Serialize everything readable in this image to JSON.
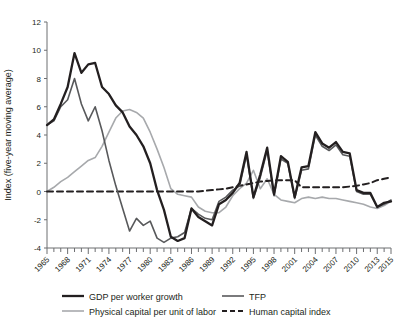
{
  "chart_data": {
    "type": "line",
    "title": "",
    "xlabel": "",
    "ylabel": "Index (five-year moving average)",
    "ylim": [
      -4,
      12
    ],
    "xlim": [
      1965,
      2015
    ],
    "ytick_labels": [
      "12",
      "10",
      "8",
      "6",
      "4",
      "2",
      "0",
      "-2",
      "-4"
    ],
    "ytick_values": [
      12,
      10,
      8,
      6,
      4,
      2,
      0,
      -2,
      -4
    ],
    "xtick_labels": [
      "1965",
      "1968",
      "1971",
      "1974",
      "1977",
      "1980",
      "1983",
      "1986",
      "1989",
      "1992",
      "1995",
      "1998",
      "2001",
      "2004",
      "2007",
      "2010",
      "2013",
      "2015"
    ],
    "xtick_values": [
      1965,
      1968,
      1971,
      1974,
      1977,
      1980,
      1983,
      1986,
      1989,
      1992,
      1995,
      1998,
      2001,
      2004,
      2007,
      2010,
      2013,
      2015
    ],
    "grid": false,
    "legend_position": "bottom",
    "x": [
      1965,
      1966,
      1967,
      1968,
      1969,
      1970,
      1971,
      1972,
      1973,
      1974,
      1975,
      1976,
      1977,
      1978,
      1979,
      1980,
      1981,
      1982,
      1983,
      1984,
      1985,
      1986,
      1987,
      1988,
      1989,
      1990,
      1991,
      1992,
      1993,
      1994,
      1995,
      1996,
      1997,
      1998,
      1999,
      2000,
      2001,
      2002,
      2003,
      2004,
      2005,
      2006,
      2007,
      2008,
      2009,
      2010,
      2011,
      2012,
      2013,
      2014,
      2015
    ],
    "series": [
      {
        "name": "GDP per worker growth",
        "color": "#231f20",
        "width": 2.3,
        "dash": "none",
        "values": [
          4.7,
          5.1,
          6.2,
          7.4,
          9.8,
          8.4,
          9.0,
          9.1,
          7.4,
          6.9,
          6.1,
          5.6,
          4.6,
          4.0,
          3.2,
          2.0,
          0.1,
          -1.3,
          -3.2,
          -3.5,
          -3.3,
          -1.2,
          -1.8,
          -2.1,
          -2.4,
          -0.9,
          -0.6,
          -0.1,
          0.6,
          2.8,
          -0.4,
          1.2,
          3.1,
          -0.2,
          2.5,
          2.1,
          -0.4,
          1.7,
          1.8,
          4.2,
          3.4,
          3.1,
          3.5,
          2.8,
          2.7,
          0.1,
          -0.1,
          -0.1,
          -1.1,
          -0.8,
          -0.7
        ]
      },
      {
        "name": "TFP",
        "color": "#58595b",
        "width": 1.6,
        "dash": "none",
        "values": [
          4.7,
          5.0,
          6.0,
          6.5,
          8.0,
          6.2,
          5.0,
          6.0,
          4.3,
          2.2,
          0.4,
          -1.2,
          -2.8,
          -1.9,
          -2.4,
          -2.1,
          -3.3,
          -3.6,
          -3.3,
          -3.2,
          -2.9,
          -1.2,
          -1.6,
          -1.9,
          -2.0,
          -0.7,
          -0.4,
          0.1,
          0.4,
          2.6,
          -0.5,
          1.0,
          2.9,
          -0.3,
          2.3,
          2.0,
          -0.5,
          1.5,
          1.6,
          4.0,
          3.2,
          2.9,
          3.3,
          2.6,
          2.5,
          0.0,
          -0.2,
          -0.2,
          -1.1,
          -0.9,
          -0.6
        ]
      },
      {
        "name": "Physical capital per unit of labor",
        "color": "#a7a9ac",
        "width": 1.6,
        "dash": "none",
        "values": [
          0.0,
          0.3,
          0.7,
          1.0,
          1.4,
          1.8,
          2.2,
          2.4,
          3.2,
          4.2,
          5.2,
          5.7,
          5.8,
          5.6,
          5.2,
          4.2,
          3.0,
          1.7,
          0.2,
          -0.2,
          -0.3,
          -0.4,
          -1.1,
          -1.4,
          -1.5,
          -1.5,
          -1.1,
          -0.3,
          0.2,
          0.6,
          1.5,
          0.2,
          0.9,
          -0.2,
          -0.6,
          -0.7,
          -0.8,
          -0.5,
          -0.4,
          -0.5,
          -0.4,
          -0.5,
          -0.5,
          -0.6,
          -0.7,
          -0.8,
          -0.9,
          -1.1,
          -1.2,
          -1.0,
          -0.7
        ]
      },
      {
        "name": "Human capital index",
        "color": "#231f20",
        "width": 2.0,
        "dash": "6,4",
        "values": [
          0.0,
          0.0,
          0.0,
          0.0,
          0.0,
          0.0,
          0.0,
          0.0,
          0.0,
          0.0,
          0.0,
          0.0,
          0.0,
          0.0,
          0.0,
          0.0,
          0.0,
          0.0,
          0.0,
          0.0,
          0.0,
          0.0,
          0.0,
          0.05,
          0.1,
          0.15,
          0.2,
          0.3,
          0.4,
          0.5,
          0.6,
          0.7,
          0.75,
          0.8,
          0.8,
          0.8,
          0.8,
          0.3,
          0.3,
          0.3,
          0.3,
          0.3,
          0.3,
          0.3,
          0.35,
          0.4,
          0.5,
          0.6,
          0.8,
          0.9,
          1.0
        ]
      }
    ]
  },
  "legend": {
    "items": [
      {
        "label": "GDP per worker growth"
      },
      {
        "label": "TFP"
      },
      {
        "label": "Physical capital per unit of labor"
      },
      {
        "label": "Human capital index"
      }
    ]
  }
}
